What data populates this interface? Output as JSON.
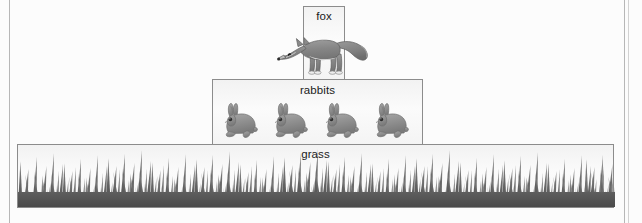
{
  "diagram": {
    "type": "energy-pyramid",
    "title": "",
    "background_color": "#fcfcfc",
    "box_border_color": "#8c8c8c",
    "animal_fill_color": "#8e8e8e",
    "grass_color": "#575757",
    "levels": [
      {
        "id": "fox",
        "label": "fox",
        "organism": "fox",
        "count": 1,
        "trophic_position": 3,
        "box": {
          "x": 303,
          "y": 6,
          "width": 42,
          "height": 74
        }
      },
      {
        "id": "rabbits",
        "label": "rabbits",
        "organism": "rabbit",
        "count": 4,
        "trophic_position": 2,
        "box": {
          "x": 212,
          "y": 79,
          "width": 211,
          "height": 66
        }
      },
      {
        "id": "grass",
        "label": "grass",
        "organism": "grass",
        "count": 0,
        "trophic_position": 1,
        "box": {
          "x": 17,
          "y": 144,
          "width": 597,
          "height": 64
        }
      }
    ]
  },
  "icons": {
    "fox": "fox-icon",
    "rabbit": "rabbit-icon",
    "grass": "grass-icon"
  }
}
